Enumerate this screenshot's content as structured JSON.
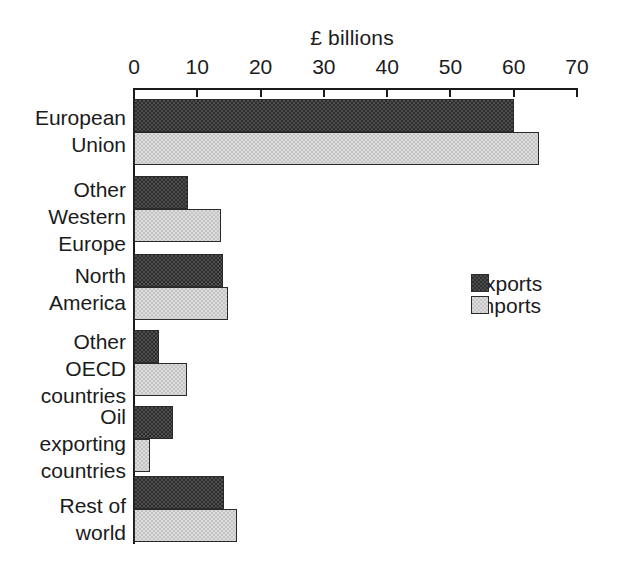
{
  "chart_data": {
    "type": "bar",
    "orientation": "horizontal",
    "title": "£ billions",
    "xlabel": "",
    "ylabel": "",
    "xlim": [
      0,
      70
    ],
    "xticks": [
      0,
      10,
      20,
      30,
      40,
      50,
      60,
      70
    ],
    "xtick_labels": [
      "0",
      "10",
      "20",
      "30",
      "40",
      "50",
      "60",
      "70"
    ],
    "grid": false,
    "legend_position": "center-right",
    "categories": [
      "European Union",
      "Other Western Europe",
      "North America",
      "Other OECD countries",
      "Oil exporting countries",
      "Rest of world"
    ],
    "category_label_lines": [
      [
        "European",
        "Union"
      ],
      [
        "Other",
        "Western",
        "Europe"
      ],
      [
        "North",
        "America"
      ],
      [
        "Other",
        "OECD",
        "countries"
      ],
      [
        "Oil",
        "exporting",
        "countries"
      ],
      [
        "Rest of",
        "world"
      ]
    ],
    "series": [
      {
        "name": "Exports",
        "color": "#4d4d4d",
        "values": [
          60.0,
          8.6,
          14.1,
          3.9,
          6.1,
          14.3
        ]
      },
      {
        "name": "Imports",
        "color": "#dcdcdc",
        "values": [
          64.0,
          13.7,
          14.9,
          8.3,
          2.5,
          16.3
        ]
      }
    ]
  },
  "chart": {
    "title": "£ billions",
    "axis": {
      "tick_labels": [
        "0",
        "10",
        "20",
        "30",
        "40",
        "50",
        "60",
        "70"
      ]
    },
    "legend": {
      "items": [
        {
          "label": "Exports",
          "swatch": "exports-swatch"
        },
        {
          "label": "Imports",
          "swatch": "imports-swatch"
        }
      ]
    },
    "categories": [
      {
        "lines": [
          "European",
          "Union"
        ]
      },
      {
        "lines": [
          "Other",
          "Western",
          "Europe"
        ]
      },
      {
        "lines": [
          "North",
          "America"
        ]
      },
      {
        "lines": [
          "Other",
          "OECD",
          "countries"
        ]
      },
      {
        "lines": [
          "Oil",
          "exporting",
          "countries"
        ]
      },
      {
        "lines": [
          "Rest of",
          "world"
        ]
      }
    ]
  }
}
